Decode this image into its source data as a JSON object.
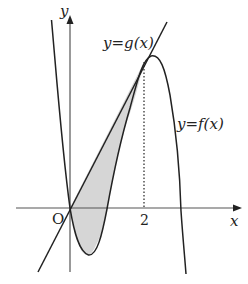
{
  "diagram": {
    "type": "function-graph",
    "labels": {
      "y_axis": "y",
      "x_axis": "x",
      "origin": "O",
      "tick_2": "2",
      "line_g": "y=g(x)",
      "curve_f": "y=f(x)"
    },
    "colors": {
      "stroke": "#222222",
      "axis": "#555555",
      "shade": "#d6d6d6"
    }
  }
}
